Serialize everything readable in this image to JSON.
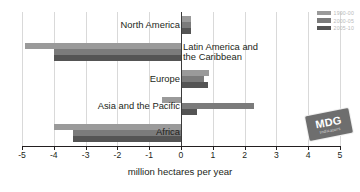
{
  "chart_data": {
    "type": "bar",
    "orientation": "horizontal",
    "title": "",
    "xlabel": "million hectares per year",
    "ylabel": "",
    "xlim": [
      -5,
      5
    ],
    "xticks": [
      -5,
      -4,
      -3,
      -2,
      -1,
      0,
      1,
      2,
      3,
      4,
      5
    ],
    "xtick_labels": [
      "-5",
      "-4",
      "-3",
      "-2",
      "-1",
      "0",
      "1",
      "2",
      "3",
      "4",
      "5"
    ],
    "grid": true,
    "legend_position": "top-right",
    "categories": [
      "North America",
      "Latin America and\nthe Caribbean",
      "Europe",
      "Asia and the Pacific",
      "Africa"
    ],
    "series": [
      {
        "name": "1990-00",
        "color": "#9a9a9a",
        "values": [
          0.3,
          -4.9,
          0.88,
          -0.6,
          -4.0
        ]
      },
      {
        "name": "2000-05",
        "color": "#7b7b7b",
        "values": [
          0.32,
          -4.0,
          0.72,
          2.3,
          -3.4
        ]
      },
      {
        "name": "2005-10",
        "color": "#545454",
        "values": [
          0.33,
          -4.0,
          0.85,
          0.5,
          -3.4
        ]
      }
    ]
  },
  "axis": {
    "title": "million hectares per year",
    "tick_labels": [
      "-5",
      "-4",
      "-3",
      "-2",
      "-1",
      "0",
      "1",
      "2",
      "3",
      "4",
      "5"
    ]
  },
  "legend": {
    "entries": [
      {
        "label": "1990-00",
        "color": "#9a9a9a"
      },
      {
        "label": "2000-05",
        "color": "#7b7b7b"
      },
      {
        "label": "2005-10",
        "color": "#545454"
      }
    ]
  },
  "logo": {
    "main": "MDG",
    "sub": "Indicators"
  }
}
